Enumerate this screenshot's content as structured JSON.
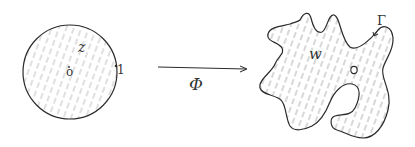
{
  "diagram": {
    "disk": {
      "variable_label": "z",
      "center_label": "o",
      "boundary_point_label": "1"
    },
    "map": {
      "label": "Φ"
    },
    "domain": {
      "variable_label": "w",
      "point_label": "o",
      "boundary_label": "Γ"
    },
    "colors": {
      "stroke": "#2b2b2b",
      "hatch": "#9a9a9a"
    }
  }
}
